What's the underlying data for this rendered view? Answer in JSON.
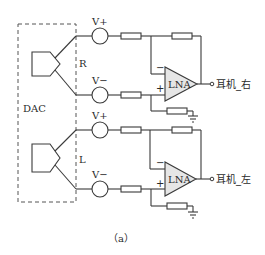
{
  "diagram": {
    "type": "circuit-schematic",
    "dac_box": {
      "label": "DAC"
    },
    "channels": [
      {
        "id": "right",
        "channel_label": "R",
        "source_pos_label": "V+",
        "source_neg_label": "V−",
        "amp_label": "LNA",
        "minus_sign": "−",
        "plus_sign": "+",
        "output_label": "耳机_右"
      },
      {
        "id": "left",
        "channel_label": "L",
        "source_pos_label": "V+",
        "source_neg_label": "V−",
        "amp_label": "LNA",
        "minus_sign": "−",
        "plus_sign": "+",
        "output_label": "耳机_左"
      }
    ],
    "caption": "（a）",
    "colors": {
      "line": "#3a3a3a",
      "amp_fill": "#e6e6e6",
      "background": "#ffffff"
    }
  }
}
